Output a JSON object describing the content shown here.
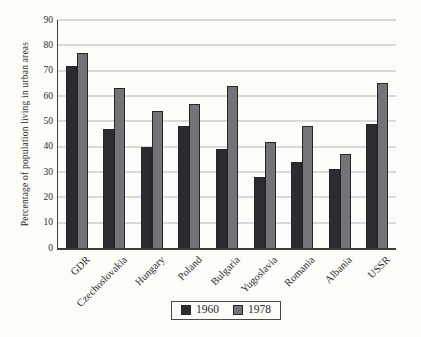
{
  "chart_data": {
    "type": "bar",
    "ylabel": "Percentage of population living in urban areas",
    "xlabel": "",
    "ylim": [
      0,
      90
    ],
    "yticks": [
      0,
      10,
      20,
      30,
      40,
      50,
      60,
      70,
      80,
      90
    ],
    "grid": true,
    "legend_position": "bottom-center",
    "categories": [
      "GDR",
      "Czechoslovakia",
      "Hungary",
      "Poland",
      "Bulgaria",
      "Yugoslavia",
      "Romania",
      "Albania",
      "USSR"
    ],
    "series": [
      {
        "name": "1960",
        "color": "#2b2b31",
        "values": [
          72,
          47,
          40,
          48,
          39,
          28,
          34,
          31,
          49
        ]
      },
      {
        "name": "1978",
        "color": "#747478",
        "values": [
          77,
          63,
          54,
          57,
          64,
          42,
          48,
          37,
          65
        ]
      }
    ]
  },
  "colors": {
    "grid": "#b5b5b5",
    "axis": "#3c3c3c",
    "text": "#2b2b2b",
    "bar_outline": "#26262a",
    "legend_border": "#4a4a4a",
    "background": "#fcfcf9"
  }
}
